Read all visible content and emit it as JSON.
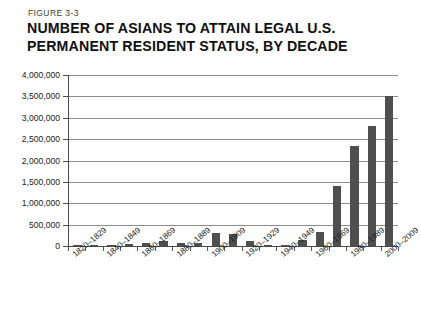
{
  "figure": {
    "label": "FIGURE 3-3",
    "title_line1": "NUMBER OF ASIANS TO ATTAIN LEGAL U.S.",
    "title_line2": "PERMANENT RESIDENT STATUS, BY DECADE"
  },
  "style": {
    "bar_color": "#4f4f4f",
    "grid_color": "#8d8d8d",
    "axis_color": "#4a4a4a",
    "background": "#ffffff",
    "text_color": "#1c1c1c"
  },
  "chart_data": {
    "type": "bar",
    "title": "NUMBER OF ASIANS TO ATTAIN LEGAL U.S. PERMANENT RESIDENT STATUS, BY DECADE",
    "xlabel": "",
    "ylabel": "",
    "ylim": [
      0,
      4000000
    ],
    "grid": true,
    "legend": false,
    "ytick_labels": [
      "4,000,000",
      "3,500,000",
      "3,000,000",
      "2,500,000",
      "2,000,000",
      "1,500,000",
      "1,000,000",
      "500,000",
      "0"
    ],
    "ytick_values": [
      4000000,
      3500000,
      3000000,
      2500000,
      2000000,
      1500000,
      1000000,
      500000,
      0
    ],
    "categories": [
      "1820–1829",
      "1830–1839",
      "1840–1849",
      "1850–1859",
      "1860–1869",
      "1870–1879",
      "1880–1889",
      "1890–1899",
      "1900–1909",
      "1910–1919",
      "1920–1929",
      "1930–1939",
      "1940–1949",
      "1950–1959",
      "1960–1969",
      "1970–1979",
      "1980–1989",
      "1990–1999",
      "2000–2009"
    ],
    "visible_tick_labels": [
      "1820–1829",
      "1840–1849",
      "1860–1869",
      "1880–1889",
      "1900–1909",
      "1920–1929",
      "1940–1949",
      "1960–1969",
      "1980–1989",
      "2000–2009"
    ],
    "values": [
      5000,
      5000,
      10000,
      40000,
      65000,
      125000,
      70000,
      75000,
      300000,
      270000,
      110000,
      20000,
      35000,
      150000,
      330000,
      1400000,
      2350000,
      2800000,
      3500000
    ]
  }
}
